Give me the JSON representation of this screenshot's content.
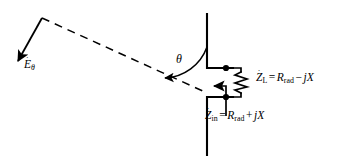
{
  "figure": {
    "type": "antenna-receiving-circuit-diagram",
    "background_color": "#ffffff",
    "stroke_color": "#000000"
  },
  "labels": {
    "efield": {
      "symbol": "E",
      "accent": "˙",
      "subscript": "θ",
      "full_text": "Ėθ"
    },
    "angle": {
      "symbol": "θ",
      "full_text": "θ"
    },
    "load_impedance": {
      "symbol": "Z",
      "accent": "˙",
      "subscript": "L",
      "equals": "=",
      "resistance": "R",
      "resistance_subscript": "rad",
      "operator": "−",
      "reactance": "jX",
      "full_text": "ŻL = Rrad − jX"
    },
    "input_impedance": {
      "symbol": "Z",
      "accent": "˙",
      "subscript": "in",
      "equals": "=",
      "resistance": "R",
      "resistance_subscript": "rad",
      "operator": "+",
      "reactance": "jX",
      "full_text": "Żin = Rrad + jX"
    }
  },
  "elements": {
    "upper_antenna_arm": "vertical-conductor-upper",
    "lower_antenna_arm": "vertical-conductor-lower",
    "upper_terminal": "feed-terminal-upper",
    "lower_terminal": "feed-terminal-lower",
    "load_resistor": "zigzag-resistor",
    "incident_ray": "dashed-propagation-ray",
    "efield_vector": "arrow-e-theta",
    "angle_arc": "arc-theta",
    "input_impedance_arrow": "arrow-z-in"
  }
}
